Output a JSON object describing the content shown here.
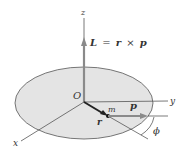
{
  "diagram": {
    "axes": {
      "x": "x",
      "y": "y",
      "z": "z"
    },
    "origin_label": "O",
    "mass_label": "m",
    "position_vector_label": "r",
    "momentum_label": "p",
    "angle_label": "ϕ",
    "angular_momentum": {
      "L": "L",
      "eq": "=",
      "r": "r",
      "times": "×",
      "p": "p"
    },
    "colors": {
      "disk_fill": "#e4e4e4",
      "disk_stroke": "#555555",
      "vector": "#8a8a8a",
      "r_vector": "#222222"
    }
  }
}
